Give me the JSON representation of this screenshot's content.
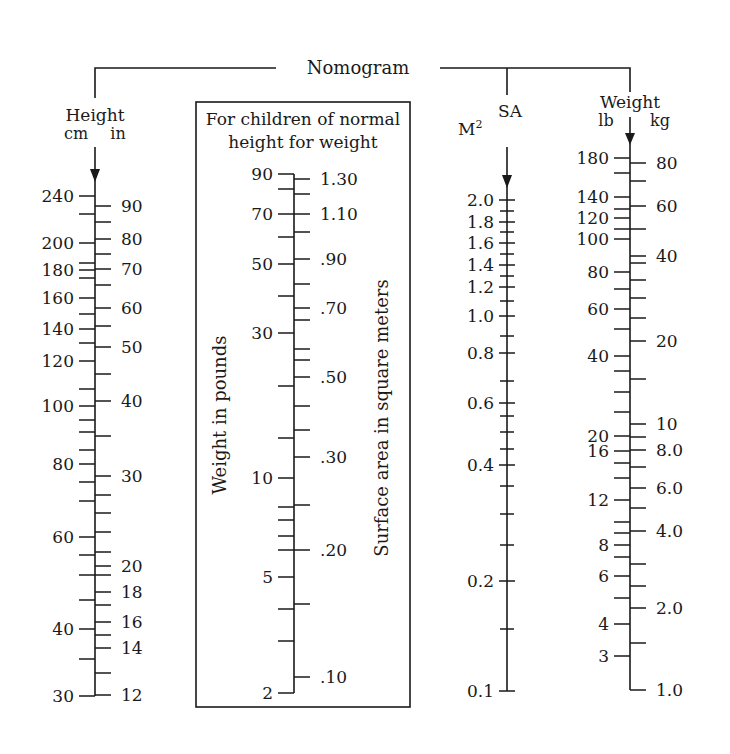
{
  "title": "Nomogram",
  "colors": {
    "ink": "#1a1a1a",
    "background": "#ffffff"
  },
  "height_scale": {
    "title": "Height",
    "unit_left": "cm",
    "unit_right": "in",
    "axis_x": 95,
    "axis_top": 147,
    "axis_bottom": 696,
    "left_labeled": [
      {
        "label": "240",
        "y": 196
      },
      {
        "label": "200",
        "y": 243
      },
      {
        "label": "180",
        "y": 270
      },
      {
        "label": "160",
        "y": 298
      },
      {
        "label": "140",
        "y": 329
      },
      {
        "label": "120",
        "y": 361
      },
      {
        "label": "100",
        "y": 406
      },
      {
        "label": "80",
        "y": 464
      },
      {
        "label": "60",
        "y": 537
      },
      {
        "label": "40",
        "y": 629
      },
      {
        "label": "30",
        "y": 696
      }
    ],
    "left_minor": [
      214,
      263,
      278,
      314,
      343,
      389,
      420,
      432,
      450,
      482,
      501,
      555,
      575,
      600,
      659
    ],
    "right_labeled": [
      {
        "label": "90",
        "y": 206
      },
      {
        "label": "80",
        "y": 239
      },
      {
        "label": "70",
        "y": 269
      },
      {
        "label": "60",
        "y": 308
      },
      {
        "label": "50",
        "y": 347
      },
      {
        "label": "40",
        "y": 401
      },
      {
        "label": "30",
        "y": 476
      },
      {
        "label": "20",
        "y": 566
      },
      {
        "label": "18",
        "y": 592
      },
      {
        "label": "16",
        "y": 622
      },
      {
        "label": "14",
        "y": 648
      },
      {
        "label": "12",
        "y": 695
      }
    ],
    "right_minor": [
      222,
      254,
      285,
      326,
      374,
      436,
      495,
      513,
      532,
      552,
      575,
      605,
      635,
      673
    ]
  },
  "child_box": {
    "heading_line1": "For children of normal",
    "heading_line2": "height for weight",
    "left_axis_title": "Weight in pounds",
    "right_axis_title": "Surface area in square meters",
    "axis_x": 294,
    "axis_top": 174,
    "axis_bottom": 693,
    "left_labeled": [
      {
        "label": "90",
        "y": 174
      },
      {
        "label": "70",
        "y": 214
      },
      {
        "label": "50",
        "y": 264
      },
      {
        "label": "30",
        "y": 333
      },
      {
        "label": "10",
        "y": 478
      },
      {
        "label": "5",
        "y": 577
      },
      {
        "label": "2",
        "y": 693
      }
    ],
    "left_minor": [
      189,
      237,
      296,
      386,
      438,
      507,
      520,
      536,
      550,
      609,
      641
    ],
    "right_labeled": [
      {
        "label": "1.30",
        "y": 179
      },
      {
        "label": "1.10",
        "y": 214
      },
      {
        "label": ".90",
        "y": 259
      },
      {
        "label": ".70",
        "y": 308
      },
      {
        "label": ".50",
        "y": 377
      },
      {
        "label": ".30",
        "y": 457
      },
      {
        "label": ".20",
        "y": 550
      },
      {
        "label": ".10",
        "y": 677
      }
    ],
    "right_minor": [
      194,
      232,
      284,
      320,
      349,
      360,
      406,
      430,
      505,
      604
    ]
  },
  "sa_scale": {
    "title": "SA",
    "unit": "M",
    "unit_superscript": "2",
    "axis_x": 507,
    "axis_top": 147,
    "axis_bottom": 691,
    "labeled": [
      {
        "label": "2.0",
        "y": 200
      },
      {
        "label": "1.8",
        "y": 222
      },
      {
        "label": "1.6",
        "y": 243
      },
      {
        "label": "1.4",
        "y": 265
      },
      {
        "label": "1.2",
        "y": 287
      },
      {
        "label": "1.0",
        "y": 316
      },
      {
        "label": "0.8",
        "y": 353
      },
      {
        "label": "0.6",
        "y": 403
      },
      {
        "label": "0.4",
        "y": 465
      },
      {
        "label": "0.2",
        "y": 581
      },
      {
        "label": "0.1",
        "y": 691
      }
    ],
    "minor": [
      211,
      232,
      254,
      276,
      301,
      336,
      381,
      416,
      432,
      449,
      486,
      514,
      545,
      629
    ]
  },
  "weight_scale": {
    "title": "Weight",
    "unit_left": "lb",
    "unit_right": "kg",
    "axis_x": 630,
    "axis_top": 117,
    "axis_bottom": 690,
    "left_labeled": [
      {
        "label": "180",
        "y": 158
      },
      {
        "label": "140",
        "y": 197
      },
      {
        "label": "120",
        "y": 218
      },
      {
        "label": "100",
        "y": 239
      },
      {
        "label": "80",
        "y": 272
      },
      {
        "label": "60",
        "y": 309
      },
      {
        "label": "40",
        "y": 356
      },
      {
        "label": "20",
        "y": 436
      },
      {
        "label": "16",
        "y": 451
      },
      {
        "label": "12",
        "y": 500
      },
      {
        "label": "8",
        "y": 545
      },
      {
        "label": "6",
        "y": 576
      },
      {
        "label": "4",
        "y": 624
      },
      {
        "label": "3",
        "y": 656
      }
    ],
    "left_minor": [
      173,
      209,
      229,
      289,
      329,
      371,
      392,
      412,
      463,
      478,
      522,
      533,
      557,
      598
    ],
    "right_labeled": [
      {
        "label": "80",
        "y": 163
      },
      {
        "label": "60",
        "y": 206
      },
      {
        "label": "40",
        "y": 256
      },
      {
        "label": "20",
        "y": 341
      },
      {
        "label": "10",
        "y": 424
      },
      {
        "label": "8.0",
        "y": 450
      },
      {
        "label": "6.0",
        "y": 488
      },
      {
        "label": "4.0",
        "y": 531
      },
      {
        "label": "2.0",
        "y": 608
      },
      {
        "label": "1.0",
        "y": 690
      }
    ],
    "right_minor": [
      181,
      229,
      263,
      280,
      298,
      318,
      379,
      437,
      467,
      508,
      564,
      586,
      643
    ]
  }
}
